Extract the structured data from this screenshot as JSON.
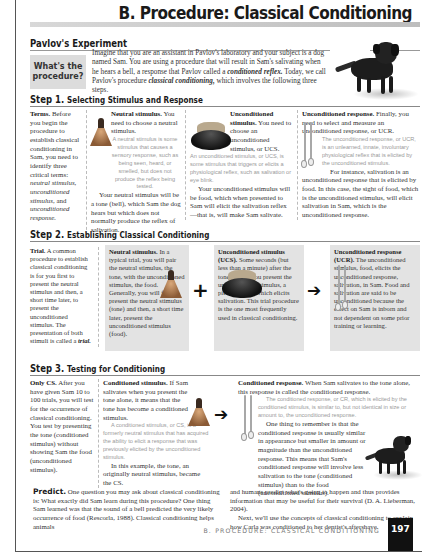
{
  "header": {
    "title": "B. Procedure: Classical Conditioning"
  },
  "pavlov": {
    "heading": "Pavlov's Experiment",
    "box_label_line1": "What's the",
    "box_label_line2": "procedure?",
    "intro_1": "Imagine that you are an assistant in Pavlov's laboratory and your subject is a dog named Sam. You are using a procedure that will result in Sam's salivating when he hears a bell, a response that Pavlov called a ",
    "intro_term1": "conditioned reflex.",
    "intro_2": " Today, we call Pavlov's procedure ",
    "intro_term2": "classical conditioning,",
    "intro_3": " which involves the following three steps."
  },
  "step1": {
    "heading_num": "Step 1.",
    "heading_sub": "Selecting Stimulus and Response",
    "terms": {
      "lead": "Terms.",
      "text": " Before you begin the procedure to establish classical conditioning in Sam, you need to identify three critical terms: ",
      "t1": "neutral stimulus,",
      "t2": "unconditioned stimulus,",
      "and": " and ",
      "t3": "unconditioned response."
    },
    "neutral": {
      "lead": "Neutral stimulus.",
      "text": " You need to choose a neutral stimulus.",
      "def": "A neutral stimulus is some stimulus that causes a sensory response, such as being seen, heard, or smelled, but does not produce the reflex being tested.",
      "body": "Your neutral stimulus will be a tone (bell), which Sam the dog hears but which does not normally produce the reflex of salivation."
    },
    "ucs": {
      "lead": "Unconditioned stimulus.",
      "text": " You need to choose an unconditioned stimulus, or UCS.",
      "def": "An unconditioned stimulus, or UCS, is some stimulus that triggers or elicits a physiological reflex, such as salivation or eye blink.",
      "body": "Your unconditioned stimulus will be food, which when presented to Sam will elicit the salivation reflex—that is, will make Sam salivate."
    },
    "ucr": {
      "lead": "Unconditioned response.",
      "text": " Finally, you need to select and measure an unconditioned response, or UCR.",
      "def": "The unconditioned response, or UCR, is an unlearned, innate, involuntary physiological reflex that is elicited by the unconditioned stimulus.",
      "body": "For instance, salivation is an unconditioned response that is elicited by food. In this case, the sight of food, which is the unconditioned stimulus, will elicit salivation in Sam, which is the unconditioned response."
    }
  },
  "step2": {
    "heading_num": "Step 2.",
    "heading_sub": "Establishing Classical Conditioning",
    "trial": {
      "lead": "Trial.",
      "text": " A common procedure to establish classical conditioning is for you first to present the neutral stimulus and then, a short time later, to present the unconditioned stimulus. The presentation of both stimuli is called a ",
      "term": "trial."
    },
    "neutral": {
      "lead": "Neutral stimulus.",
      "text": " In a typical trial, you will pair the neutral stimulus, the tone, with the unconditioned stimulus, the food. Generally, you will first present the neutral stimulus (tone) and then, a short time later, present the unconditioned stimulus (food)."
    },
    "ucs": {
      "lead": "Unconditioned stimulus (UCS).",
      "text": " Some seconds (but less than a minute) after the tone begins, you present the unconditioned stimulus, a piece of food, which elicits salivation. This trial procedure is the one most frequently used in classical conditioning."
    },
    "ucr": {
      "lead": "Unconditioned response (UCR).",
      "text": " The unconditioned stimulus, food, elicits the unconditioned response, salivation, in Sam. Food and salivation are said to be unconditioned because the effect on Sam is inborn and not dependent on some prior training or learning."
    },
    "plus_symbol": "+",
    "arrow_symbol": "➔"
  },
  "step3": {
    "heading_num": "Step 3.",
    "heading_sub": "Testing for Conditioning",
    "only_cs": {
      "lead": "Only CS.",
      "text": " After you have given Sam 10 to 100 trials, you will test for the occurrence of classical conditioning. You test by presenting the tone (conditioned stimulus) without showing Sam the food (unconditioned stimulus)."
    },
    "cs": {
      "lead": "Conditioned stimulus.",
      "text": " If Sam salivates when you present the tone alone, it means that the tone has become a conditioned stimulus.",
      "def": "A conditioned stimulus, or CS, is a formerly neutral stimulus that has acquired the ability to elicit a response that was previously elicited by the unconditioned stimulus.",
      "body": "In this example, the tone, an originally neutral stimulus, became the CS."
    },
    "cr": {
      "lead": "Conditioned response.",
      "text": " When Sam salivates to the tone alone, this response is called the conditioned response.",
      "def": "The conditioned response, or CR, which is elicited by the conditioned stimulus, is similar to, but not identical in size or amount to, the unconditioned response.",
      "body": "One thing to remember is that the conditioned response is usually similar in appearance but smaller in amount or magnitude than the unconditioned response. This means that Sam's conditioned response will involve less salivation to the tone (conditioned stimulus) than to the food (unconditioned stimulus)."
    },
    "arrow_symbol": "➔"
  },
  "predict": {
    "lead": "Predict.",
    "left": " One question you may ask about classical conditioning is: What exactly did Sam learn during this procedure? One thing Sam learned was that the sound of a bell predicted the very likely occurrence of food (Rescorla, 1988). Classical conditioning helps animals",
    "right_1": "and humans predict what's going to happen and thus provides information that may be useful for their survival (D. A. Lieberman, 2004).",
    "right_2": "Next, we'll use the concepts of classical conditioning to explain how Carla was conditioned to her dentist's aftershave."
  },
  "footer": {
    "running_head": "B. PROCEDURE: CLASSICAL CONDITIONING",
    "page_number": "197"
  }
}
